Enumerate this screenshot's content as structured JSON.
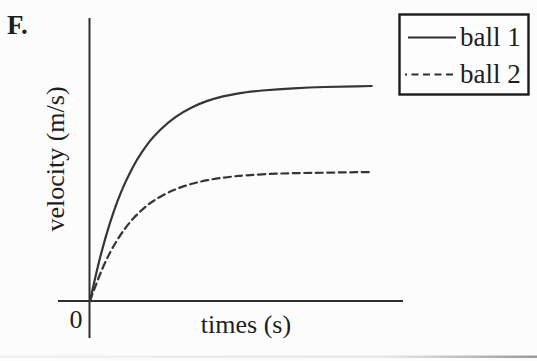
{
  "figure_label": "F.",
  "axes": {
    "ylabel": "velocity (m/s)",
    "xlabel": "times (s)",
    "origin_label": "0"
  },
  "legend": {
    "items": [
      {
        "label": "ball 1",
        "line_style": "solid"
      },
      {
        "label": "ball 2",
        "line_style": "dashed"
      }
    ]
  },
  "colors": {
    "ink": "#2e2e2e",
    "background": "#fcfcfc"
  },
  "chart_data": {
    "type": "line",
    "title": "",
    "xlabel": "times (s)",
    "ylabel": "velocity (m/s)",
    "x_range": [
      0,
      10
    ],
    "y_range": [
      0,
      1.1
    ],
    "grid": false,
    "legend_position": "top-right",
    "axis_numeric_labels": "none (only origin 0 shown; values in arbitrary units)",
    "series": [
      {
        "name": "ball 1",
        "line_style": "solid",
        "x": [
          0,
          0.25,
          0.5,
          0.75,
          1,
          1.25,
          1.5,
          1.75,
          2,
          2.5,
          3,
          3.5,
          4,
          4.5,
          5,
          6,
          7,
          8,
          9
        ],
        "y": [
          0,
          0.164,
          0.3,
          0.415,
          0.511,
          0.59,
          0.657,
          0.713,
          0.76,
          0.832,
          0.883,
          0.918,
          0.943,
          0.96,
          0.972,
          0.986,
          0.993,
          0.997,
          1.0
        ]
      },
      {
        "name": "ball 2",
        "line_style": "dashed",
        "x": [
          0,
          0.25,
          0.5,
          0.75,
          1,
          1.25,
          1.5,
          1.75,
          2,
          2.5,
          3,
          3.5,
          4,
          4.5,
          5,
          6,
          7,
          8,
          9
        ],
        "y": [
          0,
          0.101,
          0.186,
          0.256,
          0.314,
          0.362,
          0.403,
          0.436,
          0.464,
          0.506,
          0.535,
          0.555,
          0.569,
          0.578,
          0.585,
          0.593,
          0.596,
          0.598,
          0.6
        ]
      }
    ]
  }
}
